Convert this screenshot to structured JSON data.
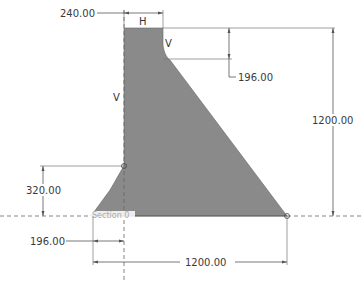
{
  "sketch": {
    "profile_fill": "#8a8a8a",
    "line_color": "#555555",
    "section_label": "Section 0"
  },
  "dimensions": {
    "top_width": "240.00",
    "top_offset_height": "196.00",
    "total_height": "1200.00",
    "left_foot_height": "320.00",
    "left_foot_width": "196.00",
    "base_width": "1200.00"
  },
  "constraints": {
    "horizontal": "H",
    "vertical_right": "V",
    "vertical_left": "V"
  }
}
